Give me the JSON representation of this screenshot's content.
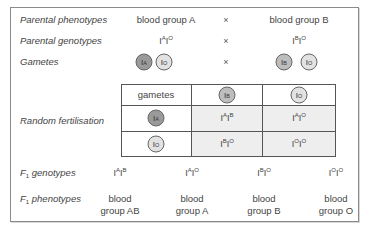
{
  "rows": {
    "parental_phenotypes": {
      "label": "Parental phenotypes",
      "left": "blood group A",
      "cross": "×",
      "right": "blood group B"
    },
    "parental_genotypes": {
      "label": "Parental genotypes",
      "left": {
        "base1": "I",
        "sup1": "A",
        "base2": "I",
        "sup2": "O"
      },
      "cross": "×",
      "right": {
        "base1": "I",
        "sup1": "B",
        "base2": "I",
        "sup2": "O"
      }
    },
    "gametes": {
      "label": "Gametes",
      "cross": "×",
      "left": [
        {
          "base": "I",
          "sup": "A",
          "shade": "dark"
        },
        {
          "base": "I",
          "sup": "O",
          "shade": "light"
        }
      ],
      "right": [
        {
          "base": "I",
          "sup": "B",
          "shade": "mid"
        },
        {
          "base": "I",
          "sup": "O",
          "shade": "light"
        }
      ]
    },
    "random_fertilisation": {
      "label": "Random fertilisation"
    },
    "f1_genotypes": {
      "label_prefix": "F",
      "label_sub": "1",
      "label_suffix": " genotypes",
      "values": [
        {
          "base1": "I",
          "sup1": "A",
          "base2": "I",
          "sup2": "B"
        },
        {
          "base1": "I",
          "sup1": "A",
          "base2": "I",
          "sup2": "O"
        },
        {
          "base1": "I",
          "sup1": "B",
          "base2": "I",
          "sup2": "O"
        },
        {
          "base1": "I",
          "sup1": "O",
          "base2": "I",
          "sup2": "O"
        }
      ]
    },
    "f1_phenotypes": {
      "label_prefix": "F",
      "label_sub": "1",
      "label_suffix": " phenotypes",
      "values": [
        {
          "line1": "blood",
          "line2": "group AB"
        },
        {
          "line1": "blood",
          "line2": "group A"
        },
        {
          "line1": "blood",
          "line2": "group B"
        },
        {
          "line1": "blood",
          "line2": "group O"
        }
      ]
    }
  },
  "punnett": {
    "corner": "gametes",
    "col_headers": [
      {
        "base": "I",
        "sup": "B",
        "shade": "mid"
      },
      {
        "base": "I",
        "sup": "O",
        "shade": "light"
      }
    ],
    "row_headers": [
      {
        "base": "I",
        "sup": "A",
        "shade": "dark"
      },
      {
        "base": "I",
        "sup": "O",
        "shade": "light"
      }
    ],
    "cells": [
      [
        {
          "base1": "I",
          "sup1": "A",
          "base2": "I",
          "sup2": "B"
        },
        {
          "base1": "I",
          "sup1": "A",
          "base2": "I",
          "sup2": "O"
        }
      ],
      [
        {
          "base1": "I",
          "sup1": "B",
          "base2": "I",
          "sup2": "O"
        },
        {
          "base1": "I",
          "sup1": "O",
          "base2": "I",
          "sup2": "O"
        }
      ]
    ]
  },
  "colors": {
    "dark": "#9a9a9a",
    "mid": "#bdbdbd",
    "light": "#e2e2e2",
    "cell_shade": "#eeeeee",
    "border": "#555555"
  }
}
